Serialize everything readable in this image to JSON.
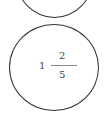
{
  "diagram": {
    "top_shape": {
      "type": "ellipse",
      "partially_visible": true
    },
    "bottom_shape": {
      "type": "ellipse",
      "content": {
        "mixed_number": {
          "whole": "1",
          "numerator": "2",
          "denominator": "5"
        }
      }
    }
  }
}
